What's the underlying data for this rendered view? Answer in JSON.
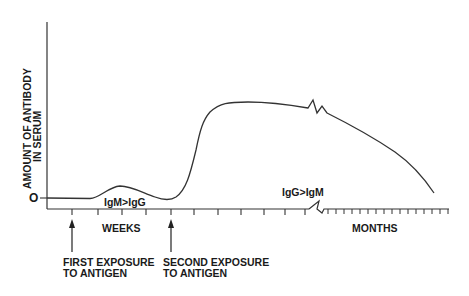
{
  "diagram": {
    "type": "antibody-response-curve",
    "y_axis_label_line1": "AMOUNT OF ANTIBODY",
    "y_axis_label_line2": "IN SERUM",
    "zero_label": "O",
    "x_axis_weeks_label": "WEEKS",
    "x_axis_months_label": "MONTHS",
    "primary_response_label": "IgM>IgG",
    "secondary_response_label": "IgG>IgM",
    "first_exposure_line1": "FIRST EXPOSURE",
    "first_exposure_line2": "TO ANTIGEN",
    "second_exposure_line1": "SECOND EXPOSURE",
    "second_exposure_line2": "TO ANTIGEN",
    "line_color": "#333333"
  }
}
